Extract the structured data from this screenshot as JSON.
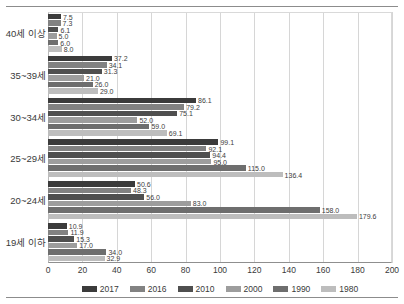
{
  "chart_data": {
    "type": "bar",
    "orientation": "horizontal",
    "title": "",
    "xlabel": "",
    "ylabel": "",
    "xlim": [
      0,
      200
    ],
    "xticks": [
      0,
      20,
      40,
      60,
      80,
      100,
      120,
      140,
      160,
      180,
      200
    ],
    "grid": true,
    "legend_position": "bottom",
    "categories": [
      "40세 이상",
      "35~39세",
      "30~34세",
      "25~29세",
      "20~24세",
      "19세 이하"
    ],
    "series": [
      {
        "name": "2017",
        "color": "#3b3b3b",
        "values": [
          7.5,
          37.2,
          86.1,
          99.1,
          50.6,
          10.9
        ]
      },
      {
        "name": "2016",
        "color": "#828282",
        "values": [
          7.3,
          34.1,
          79.2,
          92.1,
          48.3,
          11.9
        ]
      },
      {
        "name": "2010",
        "color": "#4f4f4f",
        "values": [
          6.1,
          31.3,
          75.1,
          94.4,
          56.0,
          15.3
        ]
      },
      {
        "name": "2000",
        "color": "#9d9d9d",
        "values": [
          5.0,
          21.0,
          52.0,
          95.0,
          83.0,
          17.0
        ]
      },
      {
        "name": "1990",
        "color": "#6e6e6e",
        "values": [
          6.0,
          26.0,
          59.0,
          115.0,
          158.0,
          34.0
        ]
      },
      {
        "name": "1980",
        "color": "#bdbdbd",
        "values": [
          8.0,
          29.0,
          69.1,
          136.4,
          179.6,
          32.9
        ]
      }
    ]
  }
}
